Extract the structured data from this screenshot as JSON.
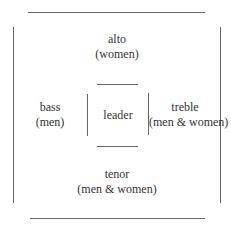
{
  "diagram": {
    "top": {
      "name": "alto",
      "members": "(women)"
    },
    "left": {
      "name": "bass",
      "members": "(men)"
    },
    "center": {
      "name": "leader"
    },
    "right": {
      "name": "treble",
      "members": "(men & women)"
    },
    "bottom": {
      "name": "tenor",
      "members": "(men & women)"
    }
  },
  "colors": {
    "line": "#666666",
    "text": "#333333"
  }
}
